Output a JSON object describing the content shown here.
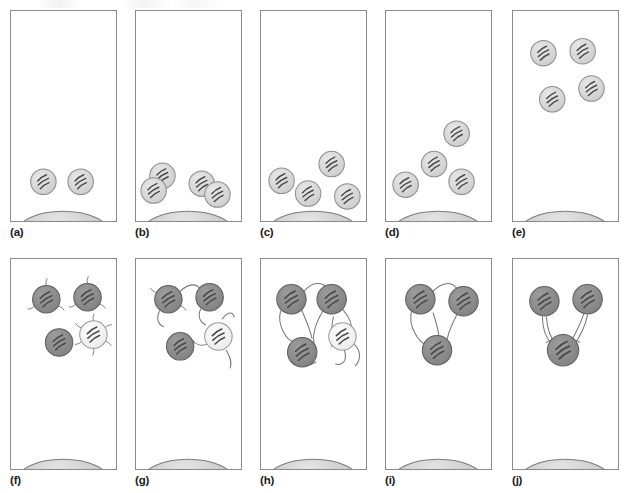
{
  "figure": {
    "type": "scientific-diagram",
    "panel_count": 10,
    "rows": 2,
    "columns": 5,
    "background_color": "#ffffff",
    "border_color": "#8a8a8a"
  },
  "palette": {
    "cell_light": "#d6d6d6",
    "cell_light_edge": "#8f8f8f",
    "cell_dark": "#8c8c8c",
    "cell_dark_edge": "#5e5e5e",
    "cell_pale": "#f2f2f2",
    "cell_pale_edge": "#9a9a9a",
    "dome_fill": "#c8c8c8",
    "dome_edge": "#7d7d7d",
    "nucleus_stripe": "#4a4a4a",
    "filament": "#777777",
    "label_color": "#1a1a1a"
  },
  "panels": [
    {
      "id": "a",
      "label": "(a)",
      "row": 0,
      "column": 0,
      "stage": "two-cells-attached",
      "dome": true,
      "cell_count": 2,
      "cell_tone": "light",
      "has_filaments": false,
      "cells": [
        {
          "cx": 33,
          "cy": 173,
          "r": 13,
          "tone": "light",
          "rot": -18,
          "pair": false
        },
        {
          "cx": 71,
          "cy": 173,
          "r": 13,
          "tone": "light",
          "rot": -18,
          "pair": false
        }
      ],
      "filaments": [],
      "spikes": []
    },
    {
      "id": "b",
      "label": "(b)",
      "row": 0,
      "column": 1,
      "stage": "cells-dividing",
      "dome": true,
      "cell_count": 4,
      "cell_tone": "light",
      "has_filaments": false,
      "cells": [
        {
          "cx": 27,
          "cy": 167,
          "r": 13,
          "tone": "light",
          "rot": -18,
          "pair": false
        },
        {
          "cx": 18,
          "cy": 182,
          "r": 13,
          "tone": "light",
          "rot": -18,
          "pair": false
        },
        {
          "cx": 67,
          "cy": 175,
          "r": 13,
          "tone": "light",
          "rot": -18,
          "pair": false
        },
        {
          "cx": 83,
          "cy": 186,
          "r": 13,
          "tone": "light",
          "rot": -18,
          "pair": false
        }
      ],
      "filaments": [],
      "spikes": []
    },
    {
      "id": "c",
      "label": "(c)",
      "row": 0,
      "column": 2,
      "stage": "four-cells-spread",
      "dome": true,
      "cell_count": 4,
      "cell_tone": "light",
      "has_filaments": false,
      "cells": [
        {
          "cx": 21,
          "cy": 172,
          "r": 13,
          "tone": "light",
          "rot": -18,
          "pair": false
        },
        {
          "cx": 48,
          "cy": 185,
          "r": 13,
          "tone": "light",
          "rot": -18,
          "pair": false
        },
        {
          "cx": 72,
          "cy": 155,
          "r": 13,
          "tone": "light",
          "rot": -18,
          "pair": false
        },
        {
          "cx": 88,
          "cy": 188,
          "r": 13,
          "tone": "light",
          "rot": -18,
          "pair": false
        }
      ],
      "filaments": [],
      "spikes": []
    },
    {
      "id": "d",
      "label": "(d)",
      "row": 0,
      "column": 3,
      "stage": "cells-migrating-upward",
      "dome": true,
      "cell_count": 4,
      "cell_tone": "light",
      "has_filaments": false,
      "cells": [
        {
          "cx": 20,
          "cy": 176,
          "r": 13,
          "tone": "light",
          "rot": -18,
          "pair": false
        },
        {
          "cx": 49,
          "cy": 155,
          "r": 13,
          "tone": "light",
          "rot": -18,
          "pair": false
        },
        {
          "cx": 77,
          "cy": 173,
          "r": 13,
          "tone": "light",
          "rot": -18,
          "pair": false
        },
        {
          "cx": 72,
          "cy": 124,
          "r": 13,
          "tone": "light",
          "rot": -18,
          "pair": false
        }
      ],
      "filaments": [],
      "spikes": []
    },
    {
      "id": "e",
      "label": "(e)",
      "row": 0,
      "column": 4,
      "stage": "cells-detached-top",
      "dome": true,
      "cell_count": 4,
      "cell_tone": "light",
      "has_filaments": false,
      "cells": [
        {
          "cx": 31,
          "cy": 42,
          "r": 13,
          "tone": "light",
          "rot": -18,
          "pair": false
        },
        {
          "cx": 71,
          "cy": 40,
          "r": 13,
          "tone": "light",
          "rot": -18,
          "pair": false
        },
        {
          "cx": 40,
          "cy": 89,
          "r": 13,
          "tone": "light",
          "rot": -18,
          "pair": false
        },
        {
          "cx": 80,
          "cy": 78,
          "r": 13,
          "tone": "light",
          "rot": -18,
          "pair": false
        }
      ],
      "filaments": [],
      "spikes": []
    },
    {
      "id": "f",
      "label": "(f)",
      "row": 1,
      "column": 0,
      "stage": "differentiation-begins",
      "dome": true,
      "cell_count": 4,
      "cell_tone": "mixed",
      "has_filaments": false,
      "cells": [
        {
          "cx": 36,
          "cy": 40,
          "r": 14,
          "tone": "dark",
          "rot": -18,
          "pair": false
        },
        {
          "cx": 78,
          "cy": 38,
          "r": 14,
          "tone": "dark",
          "rot": -18,
          "pair": false
        },
        {
          "cx": 49,
          "cy": 84,
          "r": 14,
          "tone": "dark",
          "rot": -18,
          "pair": false
        },
        {
          "cx": 84,
          "cy": 76,
          "r": 14,
          "tone": "pale",
          "rot": -18,
          "pair": false
        }
      ],
      "filaments": [],
      "spikes": [
        {
          "cx": 36,
          "cy": 40,
          "r": 14,
          "count": 3,
          "len": 7
        },
        {
          "cx": 78,
          "cy": 38,
          "r": 14,
          "count": 3,
          "len": 7
        },
        {
          "cx": 84,
          "cy": 76,
          "r": 14,
          "count": 6,
          "len": 7
        }
      ]
    },
    {
      "id": "g",
      "label": "(g)",
      "row": 1,
      "column": 1,
      "stage": "neurite-outgrowth",
      "dome": true,
      "cell_count": 4,
      "cell_tone": "mixed",
      "has_filaments": true,
      "cells": [
        {
          "cx": 33,
          "cy": 40,
          "r": 14,
          "tone": "dark",
          "rot": -18,
          "pair": false
        },
        {
          "cx": 75,
          "cy": 38,
          "r": 14,
          "tone": "dark",
          "rot": -18,
          "pair": false
        },
        {
          "cx": 45,
          "cy": 88,
          "r": 14,
          "tone": "dark",
          "rot": -18,
          "pair": false
        },
        {
          "cx": 84,
          "cy": 78,
          "r": 14,
          "tone": "pale",
          "rot": -18,
          "pair": false
        }
      ],
      "filaments": [
        "M45,32 C54,23 62,24 66,30",
        "M24,52 C20,60 23,66 28,68",
        "M66,50 C62,58 66,64 71,66",
        "M88,60 C94,52 99,53 100,58",
        "M74,70 C80,66 86,68 88,73",
        "M92,92 C96,99 98,104 96,110",
        "M72,86 C66,88 60,86 58,82"
      ],
      "spikes": [
        {
          "cx": 33,
          "cy": 40,
          "r": 14,
          "count": 2,
          "len": 7
        }
      ]
    },
    {
      "id": "h",
      "label": "(h)",
      "row": 1,
      "column": 2,
      "stage": "network-formation",
      "dome": true,
      "cell_count": 4,
      "cell_tone": "mixed",
      "has_filaments": true,
      "cells": [
        {
          "cx": 31,
          "cy": 40,
          "r": 15,
          "tone": "dark",
          "rot": -18,
          "pair": false
        },
        {
          "cx": 72,
          "cy": 40,
          "r": 15,
          "tone": "dark",
          "rot": -18,
          "pair": false
        },
        {
          "cx": 42,
          "cy": 94,
          "r": 15,
          "tone": "dark",
          "rot": -18,
          "pair": false
        },
        {
          "cx": 83,
          "cy": 78,
          "r": 14,
          "tone": "pale",
          "rot": -18,
          "pair": false
        }
      ],
      "filaments": [
        "M44,32 C52,22 62,22 67,28",
        "M20,52 C16,66 26,82 33,83",
        "M41,50 C46,62 50,70 52,80",
        "M63,52 C56,64 52,74 54,84",
        "M83,50 C90,58 94,66 92,74",
        "M74,58 C70,70 74,80 72,88",
        "M85,92 C88,102 84,108 76,106",
        "M56,104 C46,110 40,106 42,100",
        "M95,86 C102,92 102,102 96,108"
      ],
      "spikes": []
    },
    {
      "id": "i",
      "label": "(i)",
      "row": 1,
      "column": 3,
      "stage": "three-cell-network",
      "dome": true,
      "cell_count": 3,
      "cell_tone": "dark",
      "has_filaments": true,
      "cells": [
        {
          "cx": 35,
          "cy": 40,
          "r": 15,
          "tone": "dark",
          "rot": -18,
          "pair": false
        },
        {
          "cx": 79,
          "cy": 42,
          "r": 15,
          "tone": "dark",
          "rot": -18,
          "pair": false
        },
        {
          "cx": 52,
          "cy": 92,
          "r": 15,
          "tone": "dark",
          "rot": -18,
          "pair": false
        }
      ],
      "filaments": [
        "M48,32 C57,22 67,22 72,29",
        "M26,52 C22,68 34,84 40,86",
        "M48,54 C52,66 54,76 54,80",
        "M72,56 C66,68 62,78 62,84"
      ],
      "spikes": []
    },
    {
      "id": "j",
      "label": "(j)",
      "row": 1,
      "column": 4,
      "stage": "contracted-network",
      "dome": true,
      "cell_count": 3,
      "cell_tone": "dark",
      "has_filaments": true,
      "cells": [
        {
          "cx": 32,
          "cy": 42,
          "r": 15,
          "tone": "dark",
          "rot": -18,
          "pair": false
        },
        {
          "cx": 76,
          "cy": 40,
          "r": 15,
          "tone": "dark",
          "rot": -18,
          "pair": false
        },
        {
          "cx": 51,
          "cy": 92,
          "r": 16,
          "tone": "dark",
          "rot": -18,
          "pair": false
        }
      ],
      "filaments": [
        "M30,58 C30,70 34,80 40,86",
        "M34,58 C35,70 38,80 44,86",
        "M72,55 C68,68 62,78 58,85",
        "M76,56 C73,70 67,80 62,87",
        "M34,84 C40,80 44,82 42,88",
        "M68,84 C62,80 58,82 60,88"
      ],
      "spikes": []
    }
  ],
  "dome": {
    "shape": "semicircular-substrate",
    "cx": 53,
    "cy": 225,
    "rx": 47,
    "ry": 22
  }
}
